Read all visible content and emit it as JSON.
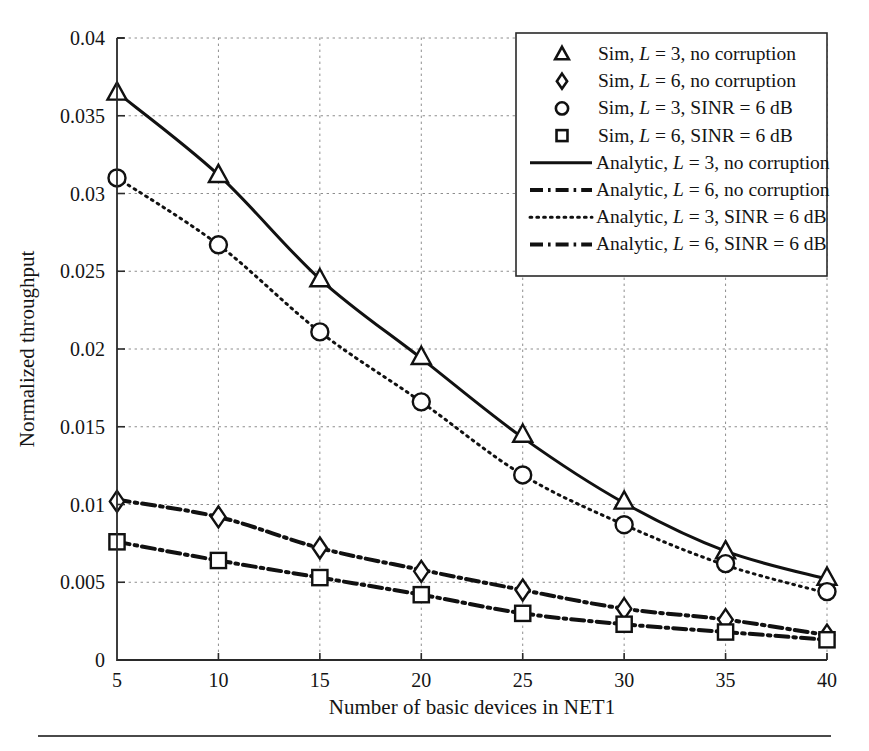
{
  "figure": {
    "background": "#ffffff",
    "line_color": "#111111"
  },
  "axes": {
    "x_title": "Number of basic devices in NET1",
    "y_title": "Normalized throughput",
    "x_ticks": [
      "5",
      "10",
      "15",
      "20",
      "25",
      "30",
      "35",
      "40"
    ],
    "y_ticks": [
      "0",
      "0.005",
      "0.01",
      "0.015",
      "0.02",
      "0.025",
      "0.03",
      "0.035",
      "0.04"
    ],
    "xlim": [
      5,
      40
    ],
    "ylim": [
      0,
      0.04
    ],
    "grid": "dotted"
  },
  "legend": {
    "position": "top-right",
    "entries": [
      {
        "marker": "triangle",
        "line": "none",
        "text_prefix": "Sim, ",
        "var": "L",
        "text_suffix": " = 3, no corruption",
        "full": "Sim, L = 3, no corruption"
      },
      {
        "marker": "diamond",
        "line": "none",
        "text_prefix": "Sim, ",
        "var": "L",
        "text_suffix": " = 6, no corruption",
        "full": "Sim, L = 6, no corruption"
      },
      {
        "marker": "circle",
        "line": "none",
        "text_prefix": "Sim, ",
        "var": "L",
        "text_suffix": " = 3, SINR = 6 dB",
        "full": "Sim, L = 3, SINR = 6 dB"
      },
      {
        "marker": "square",
        "line": "none",
        "text_prefix": "Sim, ",
        "var": "L",
        "text_suffix": " = 6, SINR = 6 dB",
        "full": "Sim, L = 6, SINR = 6 dB"
      },
      {
        "marker": "none",
        "line": "solid",
        "text_prefix": "Analytic, ",
        "var": "L",
        "text_suffix": " = 3, no corruption",
        "full": "Analytic, L = 3, no corruption"
      },
      {
        "marker": "none",
        "line": "dashdot",
        "text_prefix": "Analytic, ",
        "var": "L",
        "text_suffix": " = 6, no corruption",
        "full": "Analytic, L = 6, no corruption"
      },
      {
        "marker": "none",
        "line": "dotted",
        "text_prefix": "Analytic, ",
        "var": "L",
        "text_suffix": " = 3, SINR = 6 dB",
        "full": "Analytic, L = 3, SINR = 6 dB"
      },
      {
        "marker": "none",
        "line": "dashdot",
        "text_prefix": "Analytic, ",
        "var": "L",
        "text_suffix": " = 6, SINR = 6 dB",
        "full": "Analytic, L = 6, SINR = 6 dB"
      }
    ]
  },
  "chart_data": {
    "type": "line",
    "title": "",
    "xlabel": "Number of basic devices in NET1",
    "ylabel": "Normalized throughput",
    "xlim": [
      5,
      40
    ],
    "ylim": [
      0,
      0.04
    ],
    "x": [
      5,
      10,
      15,
      20,
      25,
      30,
      35,
      40
    ],
    "grid": true,
    "legend_position": "top-right",
    "series": [
      {
        "name": "Analytic, L = 3, no corruption",
        "style": "solid",
        "marker": "none",
        "values": [
          0.0365,
          0.0312,
          0.0245,
          0.0194,
          0.0143,
          0.0101,
          0.007,
          0.0052
        ]
      },
      {
        "name": "Sim, L = 3, no corruption",
        "style": "markers",
        "marker": "triangle",
        "values": [
          0.0365,
          0.0312,
          0.0245,
          0.0195,
          0.0145,
          0.0102,
          0.007,
          0.0053
        ]
      },
      {
        "name": "Analytic, L = 3, SINR = 6 dB",
        "style": "dotted",
        "marker": "none",
        "values": [
          0.031,
          0.0267,
          0.0211,
          0.0166,
          0.0119,
          0.0087,
          0.0061,
          0.0043
        ]
      },
      {
        "name": "Sim, L = 3, SINR = 6 dB",
        "style": "markers",
        "marker": "circle",
        "values": [
          0.031,
          0.0267,
          0.0211,
          0.0166,
          0.0119,
          0.0087,
          0.0062,
          0.0044
        ]
      },
      {
        "name": "Analytic, L = 6, no corruption",
        "style": "dashdot",
        "marker": "none",
        "values": [
          0.0103,
          0.0092,
          0.0072,
          0.0058,
          0.0045,
          0.0033,
          0.0026,
          0.0016
        ]
      },
      {
        "name": "Sim, L = 6, no corruption",
        "style": "markers",
        "marker": "diamond",
        "values": [
          0.0102,
          0.0092,
          0.0072,
          0.0057,
          0.0045,
          0.0033,
          0.0026,
          0.0016
        ]
      },
      {
        "name": "Analytic, L = 6, SINR = 6 dB",
        "style": "dashdot",
        "marker": "none",
        "values": [
          0.0076,
          0.0064,
          0.0053,
          0.0042,
          0.003,
          0.0023,
          0.0018,
          0.0013
        ]
      },
      {
        "name": "Sim, L = 6, SINR = 6 dB",
        "style": "markers",
        "marker": "square",
        "values": [
          0.0076,
          0.0064,
          0.0053,
          0.0042,
          0.003,
          0.0023,
          0.0018,
          0.0013
        ]
      }
    ]
  }
}
